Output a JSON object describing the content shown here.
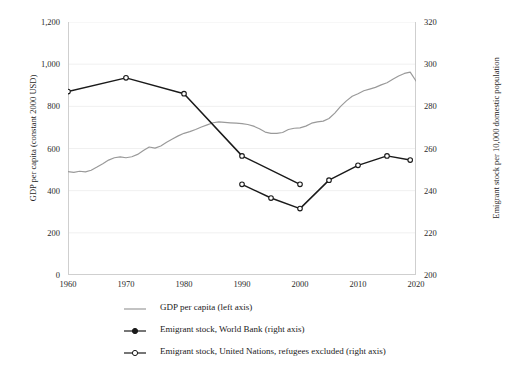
{
  "chart_data": {
    "type": "line",
    "title": "",
    "xlabel": "",
    "ylabel": "GDP per capita (constant 2000 USD)",
    "y2label": "Emigrant stock per 10,000 domestic population",
    "xlim": [
      1960,
      2020
    ],
    "ylim": [
      0,
      1200
    ],
    "y2lim": [
      200,
      320
    ],
    "xticks": [
      "1960",
      "1970",
      "1980",
      "1990",
      "2000",
      "2010",
      "2020"
    ],
    "yticks": [
      "0",
      "200",
      "400",
      "600",
      "800",
      "1,000",
      "1,200"
    ],
    "y2ticks": [
      "200",
      "220",
      "240",
      "260",
      "280",
      "300",
      "320"
    ],
    "grid": "horizontal-light",
    "legend_position": "bottom",
    "series": [
      {
        "name": "GDP per capita (left axis)",
        "axis": "left",
        "color": "#9a9a9a",
        "marker": "none",
        "x": [
          1960,
          1961,
          1962,
          1963,
          1964,
          1965,
          1966,
          1967,
          1968,
          1969,
          1970,
          1971,
          1972,
          1973,
          1974,
          1975,
          1976,
          1977,
          1978,
          1979,
          1980,
          1981,
          1982,
          1983,
          1984,
          1985,
          1986,
          1987,
          1988,
          1989,
          1990,
          1991,
          1992,
          1993,
          1994,
          1995,
          1996,
          1997,
          1998,
          1999,
          2000,
          2001,
          2002,
          2003,
          2004,
          2005,
          2006,
          2007,
          2008,
          2009,
          2010,
          2011,
          2012,
          2013,
          2014,
          2015,
          2016,
          2017,
          2018,
          2019,
          2020
        ],
        "values": [
          490,
          487,
          492,
          489,
          497,
          512,
          528,
          545,
          556,
          560,
          556,
          561,
          572,
          590,
          607,
          602,
          612,
          630,
          645,
          660,
          672,
          680,
          690,
          702,
          712,
          722,
          726,
          724,
          722,
          720,
          718,
          714,
          706,
          694,
          678,
          672,
          672,
          676,
          690,
          696,
          698,
          706,
          720,
          726,
          730,
          742,
          768,
          800,
          826,
          848,
          860,
          874,
          882,
          890,
          902,
          912,
          928,
          944,
          956,
          962,
          920
        ]
      },
      {
        "name": "Emigrant stock, World Bank (right axis)",
        "axis": "right",
        "color": "#1a1a1a",
        "marker": "circle-open",
        "x": [
          1960,
          1970,
          1980,
          1990,
          2000
        ],
        "values": [
          287,
          293.5,
          286,
          256.5,
          243
        ]
      },
      {
        "name": "Emigrant stock, United Nations, refugees excluded (right axis)",
        "axis": "right",
        "color": "#1a1a1a",
        "marker": "circle-open",
        "x": [
          1990,
          1995,
          2000,
          2005,
          2010,
          2015,
          2019
        ],
        "values": [
          243,
          236.5,
          231.5,
          245,
          252,
          256.5,
          254.5
        ]
      }
    ]
  },
  "legend": {
    "items": [
      {
        "label": "GDP per capita (left axis)",
        "symbol": "line-plain",
        "color": "#9a9a9a"
      },
      {
        "label": "Emigrant stock, World Bank (right axis)",
        "symbol": "line-filled-marker",
        "color": "#1a1a1a"
      },
      {
        "label": "Emigrant stock, United Nations, refugees excluded (right axis)",
        "symbol": "line-open-marker",
        "color": "#1a1a1a"
      }
    ]
  }
}
